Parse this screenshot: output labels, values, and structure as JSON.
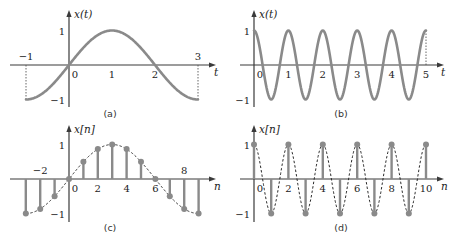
{
  "chart_data": [
    {
      "id": "a",
      "type": "line",
      "caption": "(a)",
      "ylabel": "x(t)",
      "xlabel": "t",
      "function": "sin(pi*t/2)",
      "xlim": [
        -1,
        3
      ],
      "ylim": [
        -1,
        1
      ],
      "x_ticks": [
        {
          "v": -1,
          "label": "−1",
          "pos": "above"
        },
        {
          "v": 0,
          "label": "0",
          "pos": "below"
        },
        {
          "v": 1,
          "label": "1",
          "pos": "below"
        },
        {
          "v": 2,
          "label": "2",
          "pos": "below"
        },
        {
          "v": 3,
          "label": "3",
          "pos": "above"
        }
      ],
      "y_ticks": [
        {
          "v": 1,
          "label": "1"
        },
        {
          "v": -1,
          "label": "−1"
        }
      ],
      "guides": [
        -1,
        3
      ],
      "x": [
        -1,
        -0.5,
        0,
        0.5,
        1,
        1.5,
        2,
        2.5,
        3
      ],
      "values": [
        -1,
        -0.707,
        0,
        0.707,
        1,
        0.707,
        0,
        -0.707,
        -1
      ]
    },
    {
      "id": "b",
      "type": "line",
      "caption": "(b)",
      "ylabel": "x(t)",
      "xlabel": "t",
      "function": "cos(2*pi*t)",
      "xlim": [
        0,
        5
      ],
      "ylim": [
        -1,
        1
      ],
      "x_ticks": [
        {
          "v": 0,
          "label": "0",
          "pos": "below"
        },
        {
          "v": 1,
          "label": "1",
          "pos": "below"
        },
        {
          "v": 2,
          "label": "2",
          "pos": "below"
        },
        {
          "v": 3,
          "label": "3",
          "pos": "below"
        },
        {
          "v": 4,
          "label": "4",
          "pos": "below"
        },
        {
          "v": 5,
          "label": "5",
          "pos": "below"
        }
      ],
      "y_ticks": [
        {
          "v": 1,
          "label": "1"
        },
        {
          "v": -1,
          "label": "−1"
        }
      ],
      "guides": [
        5
      ],
      "x": [
        0,
        0.5,
        1,
        1.5,
        2,
        2.5,
        3,
        3.5,
        4,
        4.5,
        5
      ],
      "values": [
        1,
        -1,
        1,
        -1,
        1,
        -1,
        1,
        -1,
        1,
        -1,
        1
      ]
    },
    {
      "id": "c",
      "type": "stem",
      "caption": "(c)",
      "ylabel": "x[n]",
      "xlabel": "n",
      "function": "sin(pi*n/6)",
      "envelope": "dashed",
      "xlim": [
        -3,
        9
      ],
      "ylim": [
        -1,
        1
      ],
      "x_ticks": [
        {
          "v": -2,
          "label": "−2",
          "pos": "above"
        },
        {
          "v": 0,
          "label": "0",
          "pos": "below"
        },
        {
          "v": 2,
          "label": "2",
          "pos": "below"
        },
        {
          "v": 4,
          "label": "4",
          "pos": "below"
        },
        {
          "v": 6,
          "label": "6",
          "pos": "below"
        },
        {
          "v": 8,
          "label": "8",
          "pos": "above"
        }
      ],
      "y_ticks": [
        {
          "v": 1,
          "label": "1"
        },
        {
          "v": -1,
          "label": "−1"
        }
      ],
      "x": [
        -3,
        -2,
        -1,
        0,
        1,
        2,
        3,
        4,
        5,
        6,
        7,
        8,
        9
      ],
      "values": [
        -1,
        -0.866,
        -0.5,
        0,
        0.5,
        0.866,
        1,
        0.866,
        0.5,
        0,
        -0.5,
        -0.866,
        -1
      ]
    },
    {
      "id": "d",
      "type": "stem",
      "caption": "(d)",
      "ylabel": "x[n]",
      "xlabel": "n",
      "function": "cos(pi*n)",
      "envelope": "dashed",
      "xlim": [
        0,
        10
      ],
      "ylim": [
        -1,
        1
      ],
      "x_ticks": [
        {
          "v": 0,
          "label": "0",
          "pos": "below"
        },
        {
          "v": 2,
          "label": "2",
          "pos": "below"
        },
        {
          "v": 4,
          "label": "4",
          "pos": "below"
        },
        {
          "v": 6,
          "label": "6",
          "pos": "below"
        },
        {
          "v": 8,
          "label": "8",
          "pos": "below"
        },
        {
          "v": 10,
          "label": "10",
          "pos": "below"
        }
      ],
      "y_ticks": [
        {
          "v": 1,
          "label": "1"
        },
        {
          "v": -1,
          "label": "−1"
        }
      ],
      "x": [
        0,
        1,
        2,
        3,
        4,
        5,
        6,
        7,
        8,
        9,
        10
      ],
      "values": [
        1,
        -1,
        1,
        -1,
        1,
        -1,
        1,
        -1,
        1,
        -1,
        1
      ]
    }
  ],
  "colors": {
    "curve": "#8a8a8a",
    "axis": "#3a3a3a",
    "text": "#222222"
  }
}
